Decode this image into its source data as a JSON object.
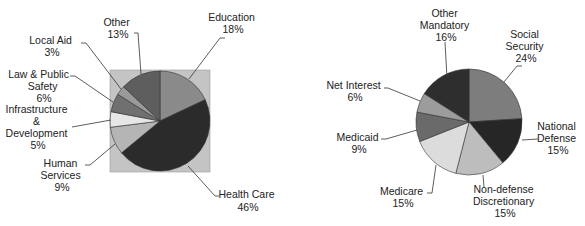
{
  "chart_data": [
    {
      "type": "pie",
      "title": "",
      "background_square": true,
      "start_angle": "12 o'clock",
      "direction": "clockwise",
      "categories": [
        "Education",
        "Health Care",
        "Human Services",
        "Infrastructure & Development",
        "Law & Public Safety",
        "Local Aid",
        "Other"
      ],
      "values": [
        18,
        46,
        9,
        5,
        6,
        3,
        13
      ],
      "unit": "%",
      "colors": [
        "#8a8a8a",
        "#2b2b2b",
        "#b5b5b5",
        "#e6e6e6",
        "#707070",
        "#9a9a9a",
        "#5e5e5e"
      ],
      "labels": [
        {
          "lines": [
            "Education",
            "18%"
          ]
        },
        {
          "lines": [
            "Health Care",
            "46%"
          ]
        },
        {
          "lines": [
            "Human",
            "Services",
            "9%"
          ]
        },
        {
          "lines": [
            "Infrastructure",
            "&",
            "Development",
            "5%"
          ]
        },
        {
          "lines": [
            "Law & Public",
            "Safety",
            "6%"
          ]
        },
        {
          "lines": [
            "Local Aid",
            "3%"
          ]
        },
        {
          "lines": [
            "Other",
            "13%"
          ]
        }
      ],
      "legend": "none (callout labels with leader lines)"
    },
    {
      "type": "pie",
      "title": "",
      "background_square": false,
      "start_angle": "12 o'clock",
      "direction": "clockwise",
      "categories": [
        "Social Security",
        "National Defense",
        "Non-defense Discretionary",
        "Medicare",
        "Medicaid",
        "Net Interest",
        "Other Mandatory"
      ],
      "values": [
        24,
        15,
        15,
        15,
        9,
        6,
        16
      ],
      "unit": "%",
      "colors": [
        "#7d7d7d",
        "#262626",
        "#bdbdbd",
        "#dcdcdc",
        "#6a6a6a",
        "#9c9c9c",
        "#2e2e2e"
      ],
      "labels": [
        {
          "lines": [
            "Social",
            "Security",
            "24%"
          ]
        },
        {
          "lines": [
            "National",
            "Defense",
            "15%"
          ]
        },
        {
          "lines": [
            "Non-defense",
            "Discretionary",
            "15%"
          ]
        },
        {
          "lines": [
            "Medicare",
            "15%"
          ]
        },
        {
          "lines": [
            "Medicaid",
            "9%"
          ]
        },
        {
          "lines": [
            "Net Interest",
            "6%"
          ]
        },
        {
          "lines": [
            "Other",
            "Mandatory",
            "16%"
          ]
        }
      ],
      "legend": "none (callout labels with leader lines)"
    }
  ],
  "layout": {
    "square_color": "#c4c4c4"
  }
}
